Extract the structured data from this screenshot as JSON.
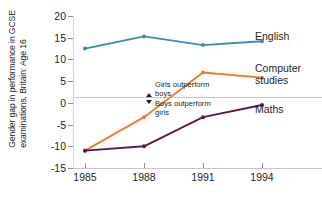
{
  "chart_data": {
    "type": "line",
    "title": "",
    "subtitle": "",
    "xlabel": "",
    "ylabel": "Gender gap in performance in GCSE examinations, Britain: Age 16",
    "ylabel_lines": [
      "Gender gap in performance in GCSE",
      "examinations, Britain: Age 16"
    ],
    "categories": [
      "1985",
      "1988",
      "1991",
      "1994"
    ],
    "x": [
      1985,
      1988,
      1991,
      1994
    ],
    "xlim": [
      1985,
      1994
    ],
    "ylim": [
      -15,
      20
    ],
    "yticks": [
      20,
      15,
      10,
      5,
      0,
      -5,
      -10,
      -15
    ],
    "ytick_labels": [
      "20",
      "15",
      "10",
      "5",
      "0",
      "-5",
      "-10",
      "-15"
    ],
    "grid": false,
    "zero_line": true,
    "legend": "right-inline-labels",
    "series": [
      {
        "name": "English",
        "color": "#3c8da6",
        "values": [
          12.5,
          15.3,
          13.3,
          14.2
        ]
      },
      {
        "name": "Computer studies",
        "color": "#ee7b32",
        "values": [
          -11.0,
          -3.3,
          7.0,
          5.8
        ]
      },
      {
        "name": "Maths",
        "color": "#5c1a4a",
        "values": [
          -11.0,
          -10.0,
          -3.3,
          -0.5
        ]
      }
    ],
    "annotations": [
      {
        "id": "girls",
        "marker": "triangle-up",
        "lines": [
          "Girls outperform",
          "boys"
        ]
      },
      {
        "id": "boys",
        "marker": "triangle-down",
        "lines": [
          "Boys outperform",
          "girls"
        ]
      }
    ],
    "series_labels": {
      "english": "English",
      "computer_line1": "Computer",
      "computer_line2": "studies",
      "maths": "Maths"
    },
    "colors": {
      "english": "#3c8da6",
      "computer_studies": "#ee7b32",
      "maths": "#5c1a4a",
      "axis": "#c9c3c9",
      "zero_line": "#c7c7c7",
      "text": "#231f20",
      "background": "#ffffff"
    }
  }
}
